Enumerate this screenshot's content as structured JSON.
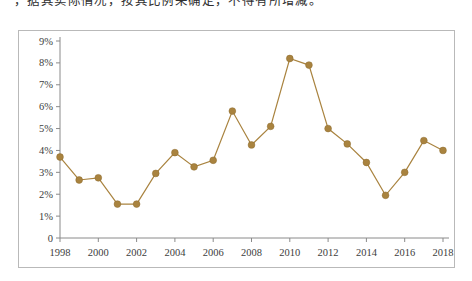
{
  "caption": {
    "text": "，据其实际情况，按其比例来确定，不得有所增减。"
  },
  "chart_data": {
    "type": "line",
    "title": "",
    "subtitle": "",
    "xlabel": "",
    "ylabel": "",
    "x": [
      1998,
      1999,
      2000,
      2001,
      2002,
      2003,
      2004,
      2005,
      2006,
      2007,
      2008,
      2009,
      2010,
      2011,
      2012,
      2013,
      2014,
      2015,
      2016,
      2017,
      2018
    ],
    "values": [
      3.7,
      2.65,
      2.75,
      1.55,
      1.55,
      2.95,
      3.9,
      3.25,
      3.55,
      5.8,
      4.25,
      5.1,
      8.2,
      7.9,
      5.0,
      4.3,
      3.45,
      1.95,
      3.0,
      4.45,
      4.0
    ],
    "series": [
      {
        "name": "",
        "values": [
          3.7,
          2.65,
          2.75,
          1.55,
          1.55,
          2.95,
          3.9,
          3.25,
          3.55,
          5.8,
          4.25,
          5.1,
          8.2,
          7.9,
          5.0,
          4.3,
          3.45,
          1.95,
          3.0,
          4.45,
          4.0
        ]
      }
    ],
    "ylim": [
      0,
      9
    ],
    "xlim": [
      1998,
      2018
    ],
    "ytick_labels": [
      "0",
      "1%",
      "2%",
      "3%",
      "4%",
      "5%",
      "6%",
      "7%",
      "8%",
      "9%"
    ],
    "ytick_values": [
      0,
      1,
      2,
      3,
      4,
      5,
      6,
      7,
      8,
      9
    ],
    "xtick_labels": [
      "1998",
      "2000",
      "2002",
      "2004",
      "2006",
      "2008",
      "2010",
      "2012",
      "2014",
      "2016",
      "2018"
    ],
    "xtick_values": [
      1998,
      2000,
      2002,
      2004,
      2006,
      2008,
      2010,
      2012,
      2014,
      2016,
      2018
    ],
    "grid": false,
    "legend": false,
    "legend_position": "none",
    "line_color": "#a9833f",
    "marker_color": "#a9833f",
    "axis_color": "#8a8a8a",
    "border_color": "#b9b9b9",
    "unit_suffix": "%"
  }
}
